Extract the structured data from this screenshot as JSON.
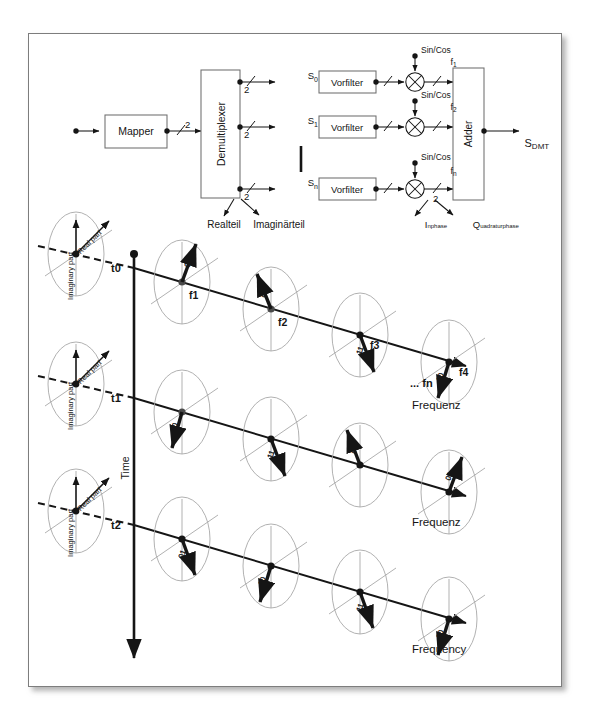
{
  "figure": {
    "frame_border_color": "#7d7d7d",
    "ink_color": "#151515",
    "ellipse_color": "#9a9a9a",
    "background": "#ffffff"
  },
  "block_diagram": {
    "blocks": [
      {
        "id": "mapper",
        "label": "Mapper"
      },
      {
        "id": "demux",
        "label": "Demultiplexer"
      },
      {
        "id": "vorfilter1",
        "label": "Vorfilter"
      },
      {
        "id": "vorfilter2",
        "label": "Vorfilter"
      },
      {
        "id": "vorfilter3",
        "label": "Vorfilter"
      },
      {
        "id": "adder",
        "label": "Adder"
      }
    ],
    "bus_widths": [
      "2",
      "2",
      "2",
      "2",
      "2"
    ],
    "branch_labels": [
      "S",
      "S",
      "S"
    ],
    "branch_subscripts": [
      "0",
      "1",
      "n"
    ],
    "carrier_label": "Sin/Cos",
    "carrier_freqs": [
      {
        "base": "f",
        "sub": "1"
      },
      {
        "base": "f",
        "sub": "2"
      },
      {
        "base": "f",
        "sub": "n"
      }
    ],
    "output": {
      "base": "S",
      "sub": "DMT"
    },
    "annotations": {
      "demux_real": "Realteil",
      "demux_imag": "Imaginärteil",
      "mixer_i": {
        "base": "I",
        "sub": "nphase"
      },
      "mixer_q": {
        "base": "Q",
        "sub": "uadraturphase"
      }
    }
  },
  "constellation_grid": {
    "time_axis_label": "Time",
    "time_markers": [
      "t0",
      "t1",
      "t2"
    ],
    "frequency_axis_labels": [
      "Frequenz",
      "Frequenz",
      "Frequency"
    ],
    "frequency_tail_label": "... fn",
    "axis_labels": {
      "imaginary": "Imaginary part",
      "real": "Real part"
    },
    "freq_markers": [
      "f1",
      "f2",
      "f3",
      "f4"
    ],
    "rows": [
      {
        "time": "t0",
        "freq_axis_label": "Frequenz",
        "shows_freq_markers": true,
        "points": [
          {
            "freq": "f1",
            "bits": "00",
            "dir": "up"
          },
          {
            "freq": "f2",
            "bits": "01",
            "dir": "up"
          },
          {
            "freq": "f3",
            "bits": "11",
            "dir": "down"
          },
          {
            "freq": "f4",
            "bits": "10",
            "dir": "down"
          }
        ]
      },
      {
        "time": "t1",
        "freq_axis_label": "Frequenz",
        "shows_freq_markers": false,
        "points": [
          {
            "freq": "f1",
            "bits": "10",
            "dir": "down"
          },
          {
            "freq": "f2",
            "bits": "11",
            "dir": "down"
          },
          {
            "freq": "f3",
            "bits": "00",
            "dir": "up"
          },
          {
            "freq": "f4",
            "bits": "01",
            "dir": "up"
          }
        ]
      },
      {
        "time": "t2",
        "freq_axis_label": "Frequency",
        "shows_freq_markers": false,
        "points": [
          {
            "freq": "f1",
            "bits": "01",
            "dir": "up"
          },
          {
            "freq": "f2",
            "bits": "10",
            "dir": "down"
          },
          {
            "freq": "f3",
            "bits": "11",
            "dir": "down"
          },
          {
            "freq": "f4",
            "bits": "00",
            "dir": "down"
          }
        ]
      }
    ]
  }
}
